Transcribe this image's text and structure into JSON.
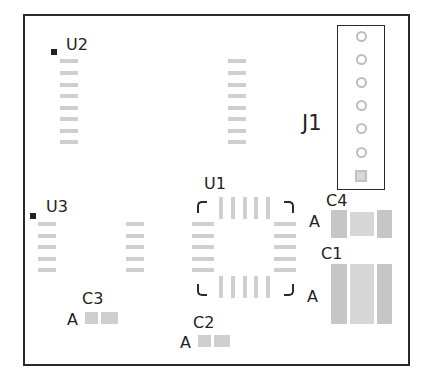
{
  "board": {
    "outline_color": "#2a2a2a",
    "pad_color": "#cfcfcf",
    "silk_color": "#222222"
  },
  "components": {
    "U2": {
      "ref": "U2",
      "pins_per_side": 8
    },
    "U3": {
      "ref": "U3",
      "pins_per_side": 5
    },
    "U1": {
      "ref": "U1",
      "pins_per_side": 5
    },
    "J1": {
      "ref": "J1",
      "pins": 7
    },
    "C1": {
      "ref": "C1",
      "polarity": "A"
    },
    "C2": {
      "ref": "C2",
      "polarity": "A"
    },
    "C3": {
      "ref": "C3",
      "polarity": "A"
    },
    "C4": {
      "ref": "C4",
      "polarity": "A"
    }
  }
}
